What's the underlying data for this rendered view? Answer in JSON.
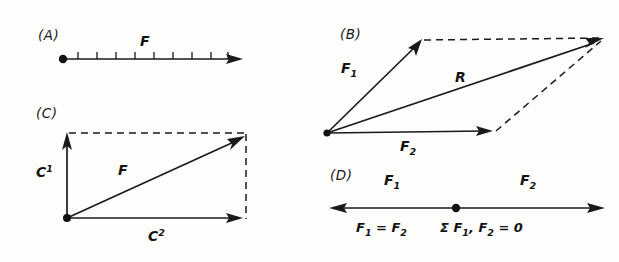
{
  "figure": {
    "background_color": "#fdfdfc",
    "ink_color": "#1a1a1a",
    "width": 619,
    "height": 262
  },
  "panels": [
    {
      "id": "A",
      "label": "(A)",
      "label_x": 38,
      "label_y": 40,
      "kind": "single-vector-scale",
      "vector_label": "F",
      "vector_label_x": 140,
      "vector_label_y": 46,
      "origin": {
        "x": 63,
        "y": 59
      },
      "tip": {
        "x": 240,
        "y": 59
      },
      "tick_count": 9,
      "tick_first_x": 78,
      "tick_spacing": 19,
      "tick_height": 7,
      "origin_dot_radius": 4.2
    },
    {
      "id": "B",
      "label": "(B)",
      "label_x": 340,
      "label_y": 39,
      "kind": "parallelogram-law",
      "origin": {
        "x": 327,
        "y": 133
      },
      "f1_tip": {
        "x": 421,
        "y": 40
      },
      "f2_tip": {
        "x": 492,
        "y": 131
      },
      "r_tip": {
        "x": 603,
        "y": 38
      },
      "f1_label": "F",
      "f1_sub": "1",
      "f1_label_x": 341,
      "f1_label_y": 73,
      "f2_label": "F",
      "f2_sub": "2",
      "f2_label_x": 400,
      "f2_label_y": 151,
      "r_label": "R",
      "r_label_x": 455,
      "r_label_y": 82,
      "origin_dot_radius": 3.6
    },
    {
      "id": "C",
      "label": "(C)",
      "label_x": 36,
      "label_y": 118,
      "kind": "component-decomposition",
      "origin": {
        "x": 67,
        "y": 218
      },
      "vertical_tip": {
        "x": 67,
        "y": 133
      },
      "horizontal_tip": {
        "x": 243,
        "y": 218
      },
      "resultant_tip": {
        "x": 245,
        "y": 136
      },
      "c1_label": "C",
      "c1_sup": "1",
      "c1_label_x": 36,
      "c1_label_y": 177,
      "c2_label": "C",
      "c2_sup": "2",
      "c2_label_x": 148,
      "c2_label_y": 241,
      "f_label": "F",
      "f_label_x": 118,
      "f_label_y": 175,
      "origin_dot_radius": 4.0
    },
    {
      "id": "D",
      "label": "(D)",
      "label_x": 330,
      "label_y": 180,
      "kind": "equilibrium-opposed-forces",
      "left_tip": {
        "x": 330,
        "y": 208
      },
      "right_tip": {
        "x": 604,
        "y": 208
      },
      "center_dot": {
        "x": 456,
        "y": 208
      },
      "center_dot_radius": 4.2,
      "f1_label": "F",
      "f1_sub": "1",
      "f1_label_x": 384,
      "f1_label_y": 185,
      "f2_label": "F",
      "f2_sub": "2",
      "f2_label_x": 520,
      "f2_label_y": 185,
      "eq_left": "F",
      "eq_left_sub": "1",
      "eq_left_rest": " = F",
      "eq_left_sub2": "2",
      "eq_left_x": 356,
      "eq_left_y": 232,
      "eq_right_sigma": "Σ",
      "eq_right_f1": " F",
      "eq_right_sub1": "1",
      "eq_right_mid": ", F",
      "eq_right_sub2": "2",
      "eq_right_end": " = 0",
      "eq_right_x": 440,
      "eq_right_y": 232
    }
  ]
}
